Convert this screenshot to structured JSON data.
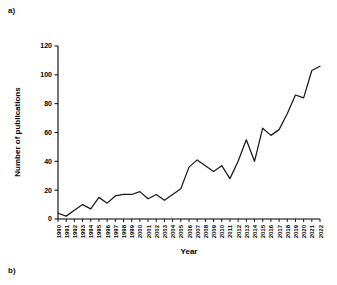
{
  "figure": {
    "panel_a_label": "a)",
    "panel_b_label": "b)"
  },
  "chart_data": {
    "type": "line",
    "title": "",
    "xlabel": "Year",
    "ylabel": "Number of publications",
    "categories": [
      "1990",
      "1991",
      "1992",
      "1993",
      "1994",
      "1995",
      "1996",
      "1997",
      "1998",
      "1999",
      "2000",
      "2001",
      "2002",
      "2003",
      "2004",
      "2005",
      "2006",
      "2007",
      "2008",
      "2009",
      "2010",
      "2011",
      "2012",
      "2013",
      "2014",
      "2015",
      "2016",
      "2017",
      "2018",
      "2019",
      "2020",
      "2021",
      "2022"
    ],
    "values": [
      4,
      2,
      6,
      10,
      7,
      15,
      11,
      16,
      17,
      17,
      19,
      14,
      17,
      13,
      17,
      21,
      36,
      41,
      37,
      33,
      37,
      28,
      40,
      55,
      40,
      63,
      58,
      62,
      73,
      86,
      84,
      103,
      106
    ],
    "series": [
      {
        "name": "Number of publications",
        "values": [
          4,
          2,
          6,
          10,
          7,
          15,
          11,
          16,
          17,
          17,
          19,
          14,
          17,
          13,
          17,
          21,
          36,
          41,
          37,
          33,
          37,
          28,
          40,
          55,
          40,
          63,
          58,
          62,
          73,
          86,
          84,
          103,
          106
        ]
      }
    ],
    "ylim": [
      0,
      120
    ],
    "yticks": [
      0,
      20,
      40,
      60,
      80,
      100,
      120
    ],
    "ytick_labels": [
      "0",
      "20",
      "40",
      "60",
      "80",
      "100",
      "120"
    ],
    "xlim": [
      "1990",
      "2022"
    ],
    "grid": false,
    "legend": null,
    "line_color": "#1a1a1a",
    "background_color": "#ffffff"
  }
}
